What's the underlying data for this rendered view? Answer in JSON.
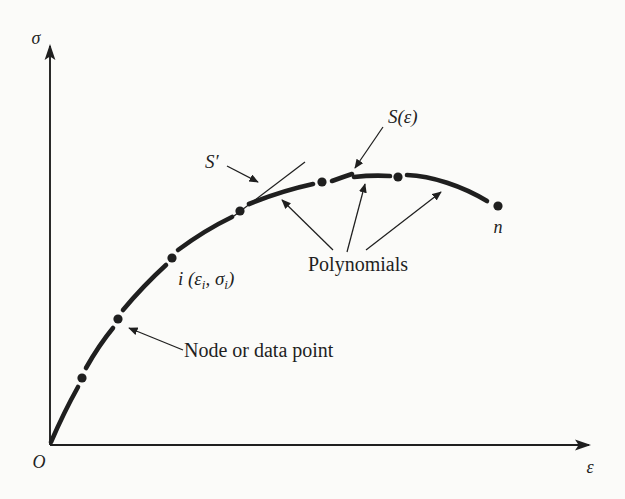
{
  "figure": {
    "colors": {
      "ink": "#1f1f1f",
      "paper": "#fbfbf9"
    },
    "axes": {
      "y_label": "σ",
      "x_label": "ε",
      "origin_label": "O"
    },
    "annotations": {
      "derivative_label": "S′",
      "spline_label": "S(ε)",
      "node_coordinate": {
        "pre": "i (ε",
        "sub1": "i",
        "mid": ", σ",
        "sub2": "i",
        "post": ")"
      },
      "node_label": "Node or data point",
      "polynomials_label": "Polynomials",
      "last_node_label": "n"
    },
    "curve": {
      "nodes": [
        {
          "x": 82,
          "y": 378
        },
        {
          "x": 118,
          "y": 319
        },
        {
          "x": 172,
          "y": 258
        },
        {
          "x": 240,
          "y": 211
        },
        {
          "x": 322,
          "y": 182
        },
        {
          "x": 398,
          "y": 177
        },
        {
          "x": 498,
          "y": 206
        }
      ],
      "node_dot_radius": 4.6
    }
  }
}
